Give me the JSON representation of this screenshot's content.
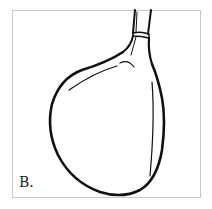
{
  "figure": {
    "label": "B.",
    "colors": {
      "stroke": "#111111",
      "frame": "#c8c8c8",
      "background": "#ffffff"
    }
  }
}
